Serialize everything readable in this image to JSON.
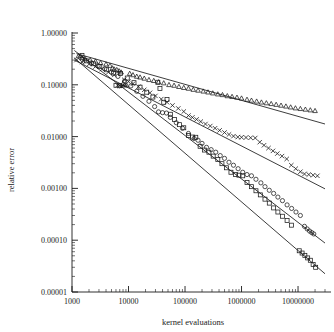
{
  "chart_data": {
    "type": "scatter",
    "title": "",
    "xlabel": "kernel evaluations",
    "ylabel": "relative error",
    "xscale": "log",
    "yscale": "log",
    "xlim": [
      1000,
      30000000
    ],
    "ylim": [
      1e-05,
      1.0
    ],
    "grid": false,
    "legend": "none",
    "xticks": [
      1000,
      10000,
      100000,
      1000000,
      10000000
    ],
    "xticklabels": [
      "1000",
      "10000",
      "100000",
      "1000000",
      "10000000"
    ],
    "yticks": [
      1.0,
      0.1,
      0.01,
      0.001,
      0.0001,
      1e-05
    ],
    "yticklabels": [
      "1.00000",
      "0.10000",
      "0.01000",
      "0.00100",
      "0.00010",
      "0.00001"
    ],
    "minor_ticks": true,
    "series": [
      {
        "name": "triangles",
        "marker": "triangle",
        "fit_line": {
          "x": [
            1200,
            30000000
          ],
          "y": [
            0.4,
            0.0175
          ]
        },
        "points": [
          [
            1300,
            0.36
          ],
          [
            1500,
            0.33
          ],
          [
            1700,
            0.32
          ],
          [
            2100,
            0.3
          ],
          [
            2600,
            0.285
          ],
          [
            3200,
            0.265
          ],
          [
            4000,
            0.25
          ],
          [
            4700,
            0.235
          ],
          [
            5200,
            0.21
          ],
          [
            5600,
            0.2
          ],
          [
            6200,
            0.195
          ],
          [
            6800,
            0.185
          ],
          [
            7400,
            0.175
          ],
          [
            8000,
            0.105
          ],
          [
            8600,
            0.1
          ],
          [
            9200,
            0.098
          ],
          [
            10500,
            0.165
          ],
          [
            12000,
            0.155
          ],
          [
            14000,
            0.145
          ],
          [
            16000,
            0.14
          ],
          [
            19000,
            0.133
          ],
          [
            23000,
            0.125
          ],
          [
            28000,
            0.12
          ],
          [
            34000,
            0.113
          ],
          [
            42000,
            0.108
          ],
          [
            52000,
            0.1
          ],
          [
            64000,
            0.097
          ],
          [
            78000,
            0.092
          ],
          [
            95000,
            0.088
          ],
          [
            115000,
            0.085
          ],
          [
            140000,
            0.081
          ],
          [
            170000,
            0.078
          ],
          [
            210000,
            0.075
          ],
          [
            255000,
            0.072
          ],
          [
            310000,
            0.069
          ],
          [
            380000,
            0.066
          ],
          [
            460000,
            0.064
          ],
          [
            560000,
            0.061
          ],
          [
            680000,
            0.059
          ],
          [
            830000,
            0.057
          ],
          [
            1000000,
            0.055
          ],
          [
            1250000,
            0.052
          ],
          [
            1500000,
            0.05
          ],
          [
            1850000,
            0.048
          ],
          [
            2250000,
            0.046
          ],
          [
            2750000,
            0.0445
          ],
          [
            3350000,
            0.043
          ],
          [
            4100000,
            0.0415
          ],
          [
            5000000,
            0.04
          ],
          [
            6100000,
            0.0385
          ],
          [
            7400000,
            0.037
          ],
          [
            9000000,
            0.0355
          ],
          [
            11000000,
            0.0345
          ],
          [
            13500000,
            0.0335
          ],
          [
            16500000,
            0.0325
          ],
          [
            20000000,
            0.0315
          ]
        ]
      },
      {
        "name": "crosses",
        "marker": "cross",
        "fit_line": {
          "x": [
            1100,
            30000000
          ],
          "y": [
            0.3,
            0.00098
          ]
        },
        "points": [
          [
            1200,
            0.3
          ],
          [
            1500,
            0.275
          ],
          [
            2000,
            0.25
          ],
          [
            2600,
            0.225
          ],
          [
            3400,
            0.2
          ],
          [
            4400,
            0.175
          ],
          [
            5600,
            0.155
          ],
          [
            6400,
            0.098
          ],
          [
            7000,
            0.096
          ],
          [
            7600,
            0.094
          ],
          [
            8400,
            0.125
          ],
          [
            10000,
            0.115
          ],
          [
            12000,
            0.105
          ],
          [
            15000,
            0.092
          ],
          [
            19000,
            0.08
          ],
          [
            24000,
            0.07
          ],
          [
            30000,
            0.061
          ],
          [
            38000,
            0.053
          ],
          [
            48000,
            0.046
          ],
          [
            60000,
            0.04
          ],
          [
            76000,
            0.035
          ],
          [
            95000,
            0.0305
          ],
          [
            115000,
            0.0255
          ],
          [
            135000,
            0.0235
          ],
          [
            160000,
            0.0215
          ],
          [
            190000,
            0.0195
          ],
          [
            230000,
            0.0175
          ],
          [
            280000,
            0.016
          ],
          [
            340000,
            0.0145
          ],
          [
            410000,
            0.0132
          ],
          [
            500000,
            0.012
          ],
          [
            600000,
            0.011
          ],
          [
            720000,
            0.0102
          ],
          [
            860000,
            0.0098
          ],
          [
            1000000,
            0.0097
          ],
          [
            1200000,
            0.0096
          ],
          [
            1450000,
            0.0095
          ],
          [
            1750000,
            0.0094
          ],
          [
            2100000,
            0.0078
          ],
          [
            2500000,
            0.0068
          ],
          [
            3000000,
            0.006
          ],
          [
            3600000,
            0.0053
          ],
          [
            4300000,
            0.0047
          ],
          [
            5200000,
            0.0042
          ],
          [
            6300000,
            0.0037
          ],
          [
            7600000,
            0.0028
          ],
          [
            9100000,
            0.0024
          ],
          [
            11000000,
            0.0021
          ],
          [
            13000000,
            0.0019
          ],
          [
            15500000,
            0.00185
          ],
          [
            18500000,
            0.0018
          ],
          [
            22000000,
            0.00175
          ]
        ]
      },
      {
        "name": "circles",
        "marker": "circle",
        "fit_line": {
          "x": [
            1100,
            30000000
          ],
          "y": [
            0.46,
            8.8e-05
          ]
        },
        "points": [
          [
            1400,
            0.34
          ],
          [
            1700,
            0.3
          ],
          [
            2200,
            0.265
          ],
          [
            2900,
            0.235
          ],
          [
            3800,
            0.205
          ],
          [
            5000,
            0.175
          ],
          [
            6500,
            0.145
          ],
          [
            8500,
            0.118
          ],
          [
            11000,
            0.095
          ],
          [
            14000,
            0.075
          ],
          [
            18000,
            0.06
          ],
          [
            23000,
            0.048
          ],
          [
            29000,
            0.038
          ],
          [
            34000,
            0.03
          ],
          [
            40000,
            0.029
          ],
          [
            47000,
            0.0285
          ],
          [
            55000,
            0.0235
          ],
          [
            70000,
            0.0185
          ],
          [
            90000,
            0.0145
          ],
          [
            115000,
            0.0115
          ],
          [
            145000,
            0.0092
          ],
          [
            170000,
            0.0085
          ],
          [
            200000,
            0.0074
          ],
          [
            240000,
            0.0062
          ],
          [
            290000,
            0.0056
          ],
          [
            350000,
            0.005
          ],
          [
            420000,
            0.0043
          ],
          [
            500000,
            0.0038
          ],
          [
            600000,
            0.0032
          ],
          [
            720000,
            0.0028
          ],
          [
            870000,
            0.0024
          ],
          [
            1050000,
            0.00205
          ],
          [
            1250000,
            0.00185
          ],
          [
            1500000,
            0.00175
          ],
          [
            1800000,
            0.0015
          ],
          [
            2200000,
            0.00128
          ],
          [
            2600000,
            0.00108
          ],
          [
            3100000,
            0.00092
          ],
          [
            3700000,
            0.0008
          ],
          [
            4400000,
            0.00068
          ],
          [
            5300000,
            0.00058
          ],
          [
            6400000,
            0.00048
          ],
          [
            7700000,
            0.00041
          ],
          [
            9200000,
            0.00035
          ],
          [
            11000000,
            0.0003
          ],
          [
            13000000,
            0.000185
          ],
          [
            14500000,
            0.000165
          ],
          [
            16000000,
            0.00015
          ],
          [
            17500000,
            0.00014
          ],
          [
            19000000,
            0.000132
          ]
        ]
      },
      {
        "name": "squares",
        "marker": "square",
        "fit_line": {
          "x": [
            1100,
            30000000
          ],
          "y": [
            0.33,
            2.25e-05
          ]
        },
        "points": [
          [
            1500,
            0.37
          ],
          [
            1800,
            0.29
          ],
          [
            2400,
            0.255
          ],
          [
            3100,
            0.225
          ],
          [
            4100,
            0.195
          ],
          [
            5400,
            0.168
          ],
          [
            6000,
            0.098
          ],
          [
            7000,
            0.096
          ],
          [
            7200,
            0.165
          ],
          [
            9500,
            0.135
          ],
          [
            12500,
            0.11
          ],
          [
            16000,
            0.09
          ],
          [
            21000,
            0.072
          ],
          [
            27000,
            0.058
          ],
          [
            33000,
            0.112
          ],
          [
            36000,
            0.085
          ],
          [
            42000,
            0.046
          ],
          [
            48000,
            0.052
          ],
          [
            55000,
            0.027
          ],
          [
            65000,
            0.0215
          ],
          [
            80000,
            0.017
          ],
          [
            95000,
            0.0148
          ],
          [
            115000,
            0.0105
          ],
          [
            135000,
            0.0098
          ],
          [
            155000,
            0.0097
          ],
          [
            185000,
            0.0065
          ],
          [
            220000,
            0.0055
          ],
          [
            265000,
            0.005
          ],
          [
            315000,
            0.0042
          ],
          [
            380000,
            0.0036
          ],
          [
            450000,
            0.003
          ],
          [
            540000,
            0.0025
          ],
          [
            650000,
            0.00205
          ],
          [
            780000,
            0.00185
          ],
          [
            900000,
            0.0018
          ],
          [
            1050000,
            0.00175
          ],
          [
            1250000,
            0.0013
          ],
          [
            1500000,
            0.00108
          ],
          [
            1800000,
            0.0009
          ],
          [
            2150000,
            0.00075
          ],
          [
            2600000,
            0.00062
          ],
          [
            3100000,
            0.00052
          ],
          [
            3700000,
            0.00042
          ],
          [
            4400000,
            0.00035
          ],
          [
            5300000,
            0.00029
          ],
          [
            6400000,
            0.00024
          ],
          [
            7700000,
            0.000195
          ],
          [
            10500000,
            6.25e-05
          ],
          [
            11800000,
            5.65e-05
          ],
          [
            13200000,
            5.1e-05
          ],
          [
            14800000,
            4.55e-05
          ],
          [
            16500000,
            4.1e-05
          ],
          [
            18500000,
            3.4e-05
          ],
          [
            20500000,
            3e-05
          ]
        ]
      }
    ]
  }
}
